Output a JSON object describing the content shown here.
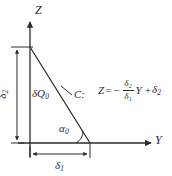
{
  "figure": {
    "kind": "geometry-diagram",
    "background_color": "#ffffff",
    "stroke_color": "#2b2b2b",
    "width": 172,
    "height": 176
  },
  "axes": {
    "vertical": {
      "label": "Z",
      "name": "z-axis",
      "direction": "up"
    },
    "horizontal": {
      "label": "Y",
      "name": "y-axis",
      "direction": "right"
    }
  },
  "shape": {
    "type": "right-triangle",
    "vertices": {
      "top": {
        "x": 30,
        "y": 47
      },
      "origin": {
        "x": 30,
        "y": 143
      },
      "right": {
        "x": 90,
        "y": 143
      }
    },
    "hypotenuse_name": "C"
  },
  "labels": {
    "region": "δQ",
    "region_sub": "0",
    "curve": "C:",
    "angle": "α",
    "angle_sub": "0",
    "dim_horizontal": "δ",
    "dim_horizontal_sub": "1",
    "dim_vertical": "δ",
    "dim_vertical_sub": "2"
  },
  "equation": {
    "lhs": "Z",
    "equals": "=",
    "minus": "−",
    "numerator": "δ",
    "numerator_sub": "2",
    "denominator": "δ",
    "denominator_sub": "1",
    "variable": "Y",
    "plus": "+",
    "constant": "δ",
    "constant_sub": "2",
    "plain": "Z = − (δ₂/δ₁) Y + δ₂"
  },
  "dimensions": {
    "horizontal": {
      "from_x": 30,
      "to_x": 90,
      "y": 154
    },
    "vertical": {
      "x": 17,
      "from_y": 47,
      "to_y": 143
    }
  }
}
